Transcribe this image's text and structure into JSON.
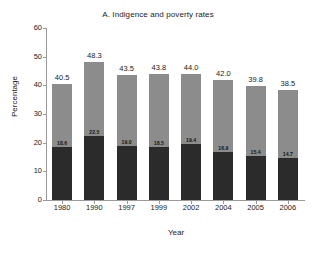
{
  "chart_data": {
    "type": "bar",
    "title": "A. Indigence and poverty rates",
    "xlabel": "Year",
    "ylabel": "Percentage",
    "categories": [
      "1980",
      "1990",
      "1997",
      "1999",
      "2002",
      "2004",
      "2005",
      "2006"
    ],
    "ylim": [
      0,
      60
    ],
    "yticks": [
      0,
      10,
      20,
      30,
      40,
      50,
      60
    ],
    "grid": false,
    "legend": "none",
    "stacked": true,
    "series": [
      {
        "name": "Indigence",
        "color": "#2b2b2b",
        "values": [
          18.6,
          22.5,
          19.0,
          18.5,
          19.4,
          16.9,
          15.4,
          14.7
        ]
      },
      {
        "name": "Poverty (upper segment)",
        "color": "#8c8c8c",
        "values": [
          21.9,
          25.8,
          24.5,
          25.3,
          24.6,
          25.1,
          24.4,
          23.8
        ]
      }
    ],
    "totals": [
      40.5,
      48.3,
      43.5,
      43.8,
      44.0,
      42.0,
      39.8,
      38.5
    ],
    "total_labels": [
      "40.5",
      "48.3",
      "43.5",
      "43.8",
      "44.0",
      "42.0",
      "39.8",
      "38.5"
    ],
    "inner_labels": [
      "18.6",
      "22.5",
      "19.0",
      "18.5",
      "19.4",
      "16.9",
      "15.4",
      "14.7"
    ],
    "ytick_labels": [
      "0",
      "10",
      "20",
      "30",
      "40",
      "50",
      "60"
    ]
  }
}
